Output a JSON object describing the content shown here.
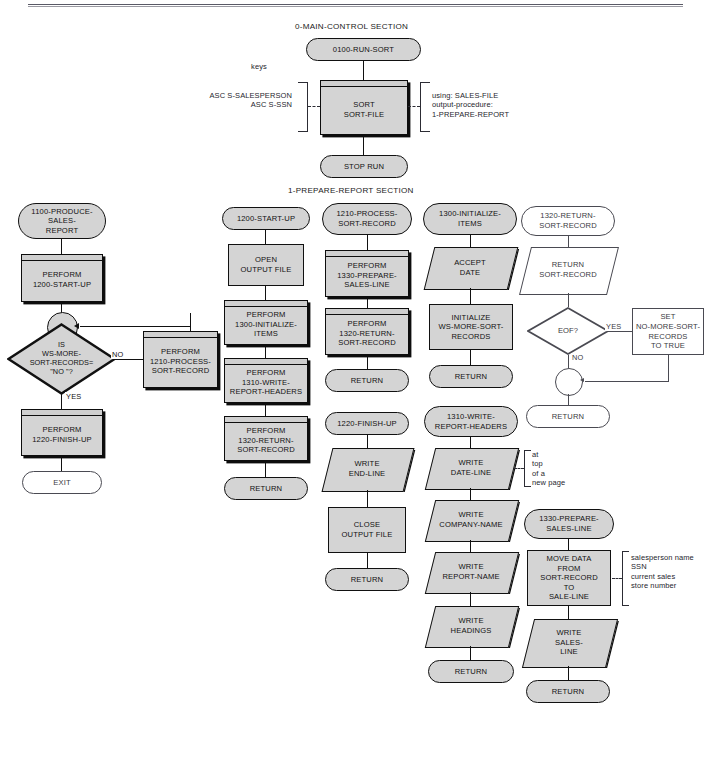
{
  "page": {
    "header_cut_text": "",
    "sections": [
      {
        "id": "main-control",
        "title": "0-MAIN-CONTROL  SECTION"
      },
      {
        "id": "prepare-report",
        "title": "1-PREPARE-REPORT SECTION"
      }
    ]
  },
  "colors": {
    "shape_fill": "#d4d4d4",
    "shape_stroke": "#111111",
    "white_shape_fill": "#ffffff",
    "white_shape_stroke": "#4a4a52",
    "background": "#ffffff"
  },
  "main_control": {
    "entry": "0100-RUN-SORT",
    "sort_box": "SORT\nSORT-FILE",
    "exit": "STOP RUN",
    "keys_caption": "keys",
    "keys_text": "ASC S-SALESPERSON\nASC S-SSN",
    "using_text": "using: SALES-FILE\noutput-procedure:\n1-PREPARE-REPORT"
  },
  "col1": {
    "entry": "1100-PRODUCE-\nSALES-\nREPORT",
    "perform_startup": "PERFORM\n1200-START-UP",
    "decision": "IS\nWS-MORE-\nSORT-RECORDS=\n\"NO \"?",
    "label_no": "NO",
    "label_yes": "YES",
    "perform_process": "PERFORM\n1210-PROCESS-\nSORT-RECORD",
    "perform_finish": "PERFORM\n1220-FINISH-UP",
    "exit": "EXIT"
  },
  "col2": {
    "entry": "1200-START-UP",
    "open": "OPEN\nOUTPUT FILE",
    "perform_init": "PERFORM\n1300-INITIALIZE-\nITEMS",
    "perform_headers": "PERFORM\n1310-WRITE-\nREPORT-HEADERS",
    "perform_return": "PERFORM\n1320-RETURN-\nSORT-RECORD",
    "return": "RETURN"
  },
  "col3_top": {
    "entry": "1210-PROCESS-\nSORT-RECORD",
    "perform_prepare": "PERFORM\n1330-PREPARE-\nSALES-LINE",
    "perform_return": "PERFORM\n1320-RETURN-\nSORT-RECORD",
    "return": "RETURN"
  },
  "col3_bottom": {
    "entry": "1220-FINISH-UP",
    "write_end": "WRITE\nEND-LINE",
    "close": "CLOSE\nOUTPUT FILE",
    "return": "RETURN"
  },
  "col4_top": {
    "entry": "1300-INITIALIZE-\nITEMS",
    "accept": "ACCEPT\nDATE",
    "initialize": "INITIALIZE\nWS-MORE-SORT-\nRECORDS",
    "return": "RETURN"
  },
  "col4_bottom": {
    "entry": "1310-WRITE-\nREPORT-HEADERS",
    "write_date": "WRITE\nDATE-LINE",
    "write_date_note": "at\ntop\nof a\nnew page",
    "write_company": "WRITE\nCOMPANY-NAME",
    "write_report": "WRITE\nREPORT-NAME",
    "write_headings": "WRITE\nHEADINGS",
    "return": "RETURN"
  },
  "col5_top": {
    "entry": "1320-RETURN-\nSORT-RECORD",
    "return_sort": "RETURN\nSORT-RECORD",
    "decision": "EOF?",
    "label_yes": "YES",
    "label_no": "NO",
    "set_box": "SET\nNO-MORE-SORT-\nRECORDS\nTO TRUE",
    "return": "RETURN"
  },
  "col5_bottom": {
    "entry": "1330-PREPARE-\nSALES-LINE",
    "move": "MOVE DATA\nFROM\nSORT-RECORD\nTO\nSALE-LINE",
    "move_note": "salesperson name\nSSN\ncurrent sales\nstore number",
    "write_sales": "WRITE\nSALES-\nLINE",
    "return": "RETURN"
  }
}
